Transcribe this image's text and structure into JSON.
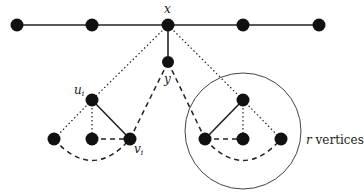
{
  "diagram": {
    "type": "graph",
    "labels": {
      "x": "x",
      "y": "y",
      "u": "u",
      "u_sub": "i",
      "v": "v",
      "v_sub": "i",
      "r": "r",
      "r_vertices_suffix": " vertices"
    },
    "colors": {
      "node": "#111111",
      "edge": "#222222",
      "circle": "#444444",
      "background": "#ffffff"
    },
    "nodes": [
      {
        "id": "t1",
        "x": 17,
        "y": 25
      },
      {
        "id": "t2",
        "x": 92,
        "y": 25
      },
      {
        "id": "x",
        "x": 168,
        "y": 25
      },
      {
        "id": "t4",
        "x": 243,
        "y": 25
      },
      {
        "id": "t5",
        "x": 319,
        "y": 25
      },
      {
        "id": "y",
        "x": 168,
        "y": 62
      },
      {
        "id": "u_i",
        "x": 92,
        "y": 100
      },
      {
        "id": "l_left",
        "x": 54,
        "y": 139
      },
      {
        "id": "l_mid",
        "x": 92,
        "y": 139
      },
      {
        "id": "v_i",
        "x": 130,
        "y": 139
      },
      {
        "id": "r_top",
        "x": 243,
        "y": 100
      },
      {
        "id": "r_left",
        "x": 205,
        "y": 139
      },
      {
        "id": "r_mid",
        "x": 243,
        "y": 139
      },
      {
        "id": "r_right",
        "x": 281,
        "y": 139
      }
    ],
    "edges": {
      "solid": [
        [
          "t1",
          "t2"
        ],
        [
          "t2",
          "x"
        ],
        [
          "x",
          "t4"
        ],
        [
          "t4",
          "t5"
        ],
        [
          "x",
          "y"
        ],
        [
          "u_i",
          "v_i"
        ],
        [
          "r_top",
          "r_left"
        ]
      ],
      "dotted": [
        [
          "x",
          "u_i"
        ],
        [
          "x",
          "r_top"
        ],
        [
          "u_i",
          "l_left"
        ],
        [
          "u_i",
          "l_mid"
        ],
        [
          "r_top",
          "r_mid"
        ],
        [
          "r_top",
          "r_right"
        ]
      ],
      "dashed": [
        [
          "y",
          "v_i"
        ],
        [
          "y",
          "r_left"
        ],
        [
          "l_mid",
          "v_i"
        ],
        [
          "r_left",
          "r_mid"
        ]
      ],
      "dashed_curves": [
        "l_left-v_i",
        "r_left-r_right"
      ]
    },
    "circle": {
      "cx": 243,
      "cy": 131,
      "r": 58
    }
  }
}
